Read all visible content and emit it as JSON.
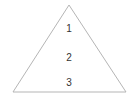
{
  "diagram": {
    "shape": "triangle",
    "stroke_color": "#b5b5b5",
    "labels": [
      {
        "text": "1"
      },
      {
        "text": "2"
      },
      {
        "text": "3"
      }
    ]
  }
}
